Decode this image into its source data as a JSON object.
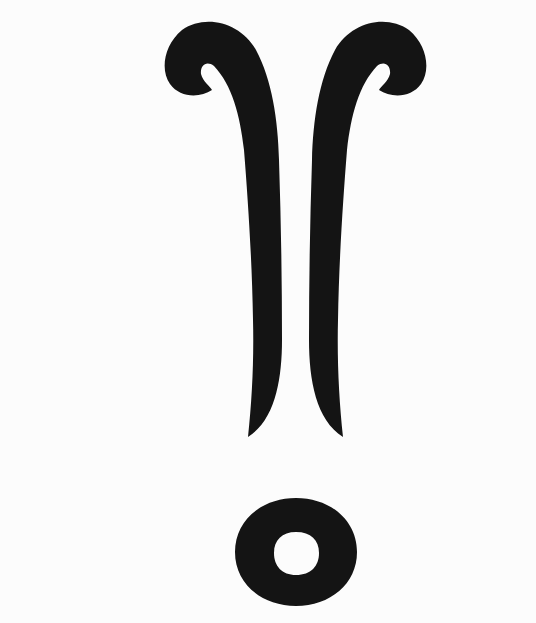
{
  "figure": {
    "colors": {
      "ink": "#141414",
      "background": "#fcfcfc"
    },
    "parts": [
      {
        "name": "left-scroll-stem"
      },
      {
        "name": "right-scroll-stem"
      },
      {
        "name": "ring"
      }
    ]
  }
}
